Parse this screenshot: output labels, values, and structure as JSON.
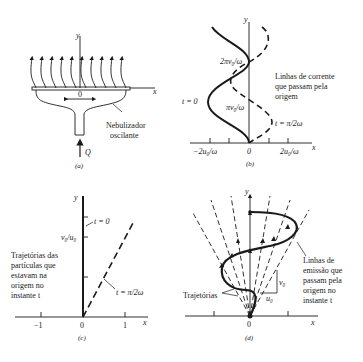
{
  "panels": {
    "a": {
      "caption": "(a)",
      "axis_x": "x",
      "axis_y": "y",
      "origin": "0",
      "flow_label": "Q",
      "device_label_line1": "Nebulizador",
      "device_label_line2": "oscilante"
    },
    "b": {
      "caption": "(b)",
      "axis_x": "x",
      "axis_y": "y",
      "tick_neg": "−2u₀/ω",
      "tick_zero": "0",
      "tick_pos": "2u₀/ω",
      "y_mark_1": "πv₀/ω",
      "y_mark_2": "2πv₀/ω",
      "curve_t0": "t = 0",
      "curve_t1": "t = π/2ω",
      "note_line1": "Linhas de corrente",
      "note_line2": "que passam pela",
      "note_line3": "origem"
    },
    "c": {
      "caption": "(c)",
      "axis_x": "x",
      "axis_y": "y",
      "tick_neg1": "−1",
      "tick_zero": "0",
      "tick_pos1": "1",
      "y_mark": "v₀/u₀",
      "curve_t0": "t = 0",
      "curve_t1": "t = π/2ω",
      "note_line1": "Trajetórias das",
      "note_line2": "partículas que",
      "note_line3": "estavam na",
      "note_line4": "origem no",
      "note_line5": "instante  t"
    },
    "d": {
      "caption": "(d)",
      "axis_x": "x",
      "axis_y": "y",
      "origin": "0",
      "v_label": "v₀",
      "u_label": "u₀",
      "traj_label": "Trajetórias",
      "note_line1": "Linhas de",
      "note_line2": "emissão que",
      "note_line3": "passam pela",
      "note_line4": "origem no",
      "note_line5": "instante  t"
    }
  }
}
